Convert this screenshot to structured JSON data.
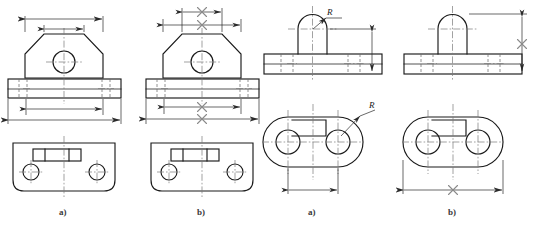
{
  "page": {
    "background_color": "#ffffff",
    "line_color": "#1a1a1a",
    "center_line_color": "#7a7a7a",
    "hidden_line_color": "#6e6e6e",
    "x_mark_color": "#8a8a8a",
    "width": 540,
    "height": 232
  },
  "groups": [
    {
      "name": "left-group",
      "description": "Bracket with angled lug, front view and top view",
      "figures": [
        {
          "key": "left-a",
          "caption": "a)",
          "correct": true,
          "dimensions": [
            {
              "name": "overall-lug-width",
              "label": "",
              "crossed_out": false,
              "orientation": "horizontal"
            },
            {
              "name": "lug-top-width",
              "label": "",
              "crossed_out": false,
              "orientation": "horizontal"
            },
            {
              "name": "base-inner-width",
              "label": "",
              "crossed_out": false,
              "orientation": "horizontal"
            },
            {
              "name": "base-overall-width",
              "label": "",
              "crossed_out": false,
              "orientation": "horizontal"
            }
          ]
        },
        {
          "key": "left-b",
          "caption": "b)",
          "correct": false,
          "dimensions": [
            {
              "name": "overall-lug-width",
              "label": "X",
              "crossed_out": true,
              "orientation": "horizontal"
            },
            {
              "name": "lug-top-width",
              "label": "X",
              "crossed_out": true,
              "orientation": "horizontal"
            },
            {
              "name": "base-inner-width",
              "label": "X",
              "crossed_out": true,
              "orientation": "horizontal"
            },
            {
              "name": "base-overall-width",
              "label": "X",
              "crossed_out": true,
              "orientation": "horizontal"
            }
          ]
        }
      ]
    },
    {
      "name": "right-group",
      "description": "Round-ended base plate with semicircular rib, front view and plan view",
      "figures": [
        {
          "key": "right-a",
          "caption": "a)",
          "correct": true,
          "radius_labels": [
            {
              "name": "rib-radius",
              "label": "R",
              "view": "front"
            },
            {
              "name": "hole-radius",
              "label": "R",
              "view": "plan"
            }
          ],
          "dimensions": [
            {
              "name": "rib-height",
              "label": "",
              "crossed_out": false,
              "orientation": "vertical"
            },
            {
              "name": "hole-centre-span",
              "label": "",
              "crossed_out": false,
              "orientation": "horizontal"
            }
          ]
        },
        {
          "key": "right-b",
          "caption": "b)",
          "correct": false,
          "radius_labels": [],
          "dimensions": [
            {
              "name": "rib-height",
              "label": "X",
              "crossed_out": true,
              "orientation": "vertical"
            },
            {
              "name": "plate-overall-width",
              "label": "X",
              "crossed_out": true,
              "orientation": "horizontal"
            }
          ]
        }
      ]
    }
  ],
  "captions": {
    "left_a": "a)",
    "left_b": "b)",
    "right_a": "a)",
    "right_b": "b)"
  },
  "labels": {
    "radius_symbol": "R",
    "cross_symbol": "X"
  }
}
